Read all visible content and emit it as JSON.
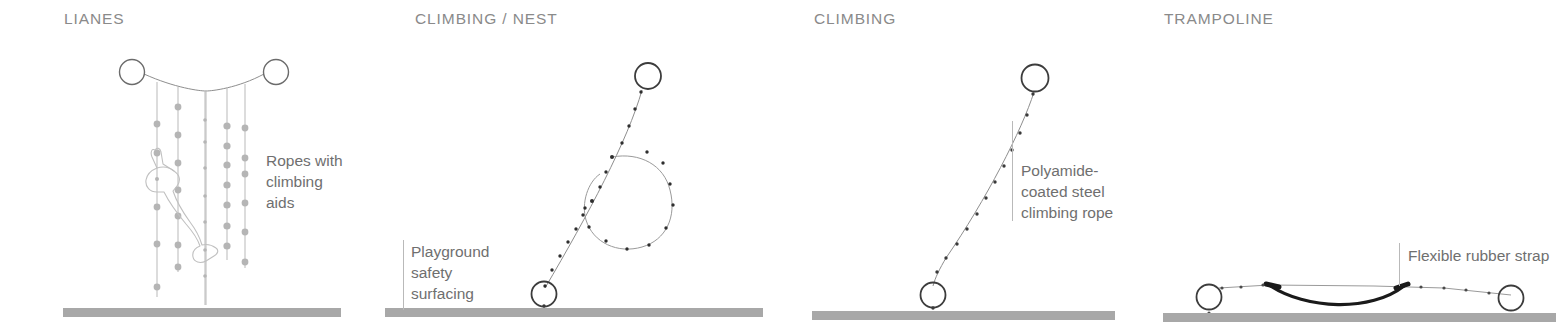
{
  "page": {
    "background": "#ffffff",
    "width": 1556,
    "height": 328,
    "ground_color": "#a8a8a8",
    "rope_color": "#9a9a9a",
    "dot_color": "#b5b5b5",
    "dark_line_color": "#3a3a3a",
    "title_color": "#8a8a8a",
    "callout_color": "#6f6f6f",
    "strap_color": "#1a1a1a"
  },
  "panels": [
    {
      "id": "lianes",
      "title": "LIANES",
      "callout": "Ropes with\nclimbing\naids",
      "has_leader_line": false,
      "ground_label": "ground-bar-lianes",
      "figure_icon": "climbing-child-figure",
      "anchors": [
        {
          "name": "top-left-anchor-ring",
          "cx": 132,
          "cy": 72,
          "r": 12.5
        },
        {
          "name": "top-right-anchor-ring",
          "cx": 276,
          "cy": 72,
          "r": 12.5
        }
      ],
      "ropes_count": 6,
      "ground": {
        "x": 63,
        "y": 308,
        "w": 278,
        "h": 9
      }
    },
    {
      "id": "climbing-nest",
      "title": "CLIMBING / NEST",
      "callout": "Playground\nsafety\nsurfacing",
      "has_leader_line": true,
      "ground_label": "ground-bar-climbing-nest",
      "anchors": [
        {
          "name": "top-anchor-ring",
          "cx": 648,
          "cy": 76,
          "r": 13
        },
        {
          "name": "bottom-anchor-ring",
          "cx": 544,
          "cy": 294,
          "r": 12.5
        }
      ],
      "ground": {
        "x": 385,
        "y": 308,
        "w": 378,
        "h": 9
      }
    },
    {
      "id": "climbing",
      "title": "CLIMBING",
      "callout": "Polyamide-\ncoated steel\nclimbing rope",
      "has_leader_line": true,
      "ground_label": "ground-bar-climbing",
      "anchors": [
        {
          "name": "top-anchor-ring",
          "cx": 1035,
          "cy": 78,
          "r": 13.5
        },
        {
          "name": "bottom-anchor-ring",
          "cx": 933,
          "cy": 295,
          "r": 12.5
        }
      ],
      "ground": {
        "x": 812,
        "y": 311,
        "w": 303,
        "h": 9
      }
    },
    {
      "id": "trampoline",
      "title": "TRAMPOLINE",
      "callout": "Flexible rubber strap",
      "has_leader_line": true,
      "ground_label": "ground-bar-trampoline",
      "anchors": [
        {
          "name": "left-anchor-ring",
          "cx": 1209,
          "cy": 297,
          "r": 12.5
        },
        {
          "name": "right-anchor-ring",
          "cx": 1511,
          "cy": 298,
          "r": 12.5
        }
      ],
      "ground": {
        "x": 1163,
        "y": 313,
        "w": 393,
        "h": 9
      }
    }
  ]
}
